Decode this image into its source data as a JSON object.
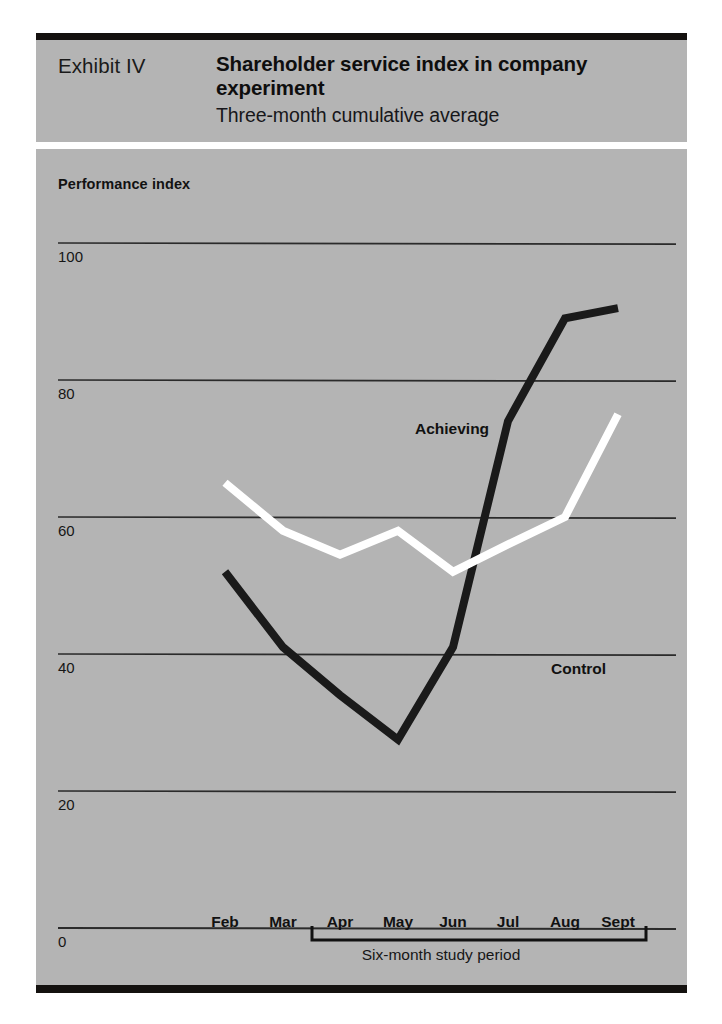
{
  "header": {
    "exhibit_label": "Exhibit IV",
    "title": "Shareholder service index in company experiment",
    "subtitle": "Three-month cumulative average"
  },
  "colors": {
    "panel_background": "#b4b4b4",
    "page_background": "#ffffff",
    "rule": "#14110f",
    "achieving_line": "#1a1a1a",
    "control_line": "#ffffff",
    "gridline": "#2b2b2b",
    "text": "#111111"
  },
  "chart_data": {
    "type": "line",
    "title": "Shareholder service index in company experiment",
    "subtitle": "Three-month cumulative average",
    "xlabel": "Six-month study period",
    "ylabel": "Performance index",
    "categories": [
      "Feb",
      "Mar",
      "Apr",
      "May",
      "Jun",
      "Jul",
      "Aug",
      "Sept"
    ],
    "yticks": [
      0,
      20,
      40,
      60,
      80,
      100
    ],
    "ylim": [
      0,
      105
    ],
    "grid": true,
    "legend": "inline-annotation",
    "series": [
      {
        "name": "Achieving",
        "color": "#1a1a1a",
        "values": [
          52,
          41,
          34,
          27.5,
          41,
          74,
          89,
          90.5
        ]
      },
      {
        "name": "Control",
        "color": "#ffffff",
        "values": [
          65,
          58,
          54.5,
          58,
          52,
          56,
          60,
          75
        ]
      }
    ],
    "annotations": [
      {
        "text": "Achieving",
        "x": "Jul",
        "y": 84
      },
      {
        "text": "Control",
        "x": "Aug",
        "y": 49
      }
    ],
    "bracket": {
      "label": "Six-month study period",
      "from": "Apr",
      "to": "Sept"
    }
  }
}
